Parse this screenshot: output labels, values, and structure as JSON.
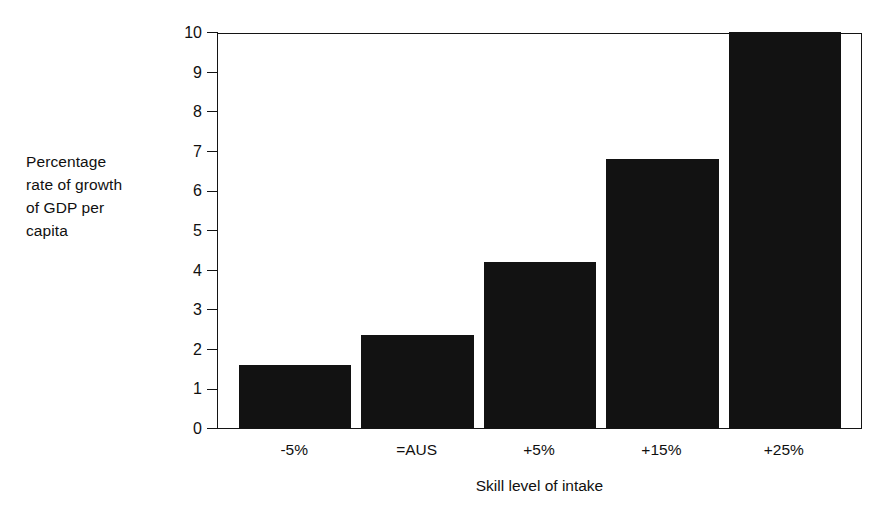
{
  "chart_data": {
    "type": "bar",
    "title": "",
    "subtitle": "",
    "xlabel": "Skill level of intake",
    "ylabel": "Percentage rate of growth of GDP per capita",
    "categories": [
      "-5%",
      "=AUS",
      "+5%",
      "+15%",
      "+25%"
    ],
    "values": [
      1.6,
      2.35,
      4.2,
      6.8,
      10.1
    ],
    "value_notes": "Last bar (+25%) is clipped at the top of the plot frame at 10",
    "ylim": [
      0,
      10
    ],
    "ytick_labels": [
      "0",
      "1",
      "2",
      "3",
      "4",
      "5",
      "6",
      "7",
      "8",
      "9",
      "10"
    ],
    "ytick_values": [
      0,
      1,
      2,
      3,
      4,
      5,
      6,
      7,
      8,
      9,
      10
    ],
    "grid": false,
    "legend": false,
    "legend_position": "none",
    "bar_color": "#121212",
    "axis_color": "#141414",
    "background_color": "#ffffff"
  },
  "ylabel_lines": [
    "Percentage",
    "rate of growth",
    "of GDP per",
    "capita"
  ]
}
